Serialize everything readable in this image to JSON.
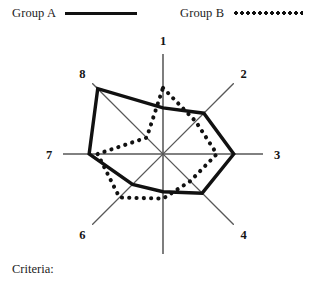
{
  "legend": {
    "entries": [
      {
        "label": "Group A",
        "style": "solid"
      },
      {
        "label": "Group B",
        "style": "dotted"
      }
    ]
  },
  "footer": {
    "criteria_label": "Criteria:"
  },
  "chart_data": {
    "type": "radar",
    "title": "",
    "xlabel": "",
    "ylabel": "",
    "grid": false,
    "legend_position": "top",
    "categories": [
      "1",
      "2",
      "3",
      "4",
      "5",
      "6",
      "7",
      "8"
    ],
    "axis_angles_deg": [
      0,
      45,
      90,
      135,
      180,
      225,
      270,
      315
    ],
    "rlim": [
      0,
      130
    ],
    "axis_radius": 100,
    "series": [
      {
        "name": "Group A",
        "style": "solid",
        "color": "#111111",
        "values": [
          60,
          75,
          92,
          72,
          49,
          56,
          96,
          120
        ]
      },
      {
        "name": "Group B",
        "style": "dotted",
        "color": "#111111",
        "values": [
          86,
          60,
          70,
          50,
          58,
          80,
          85,
          30
        ]
      }
    ]
  }
}
